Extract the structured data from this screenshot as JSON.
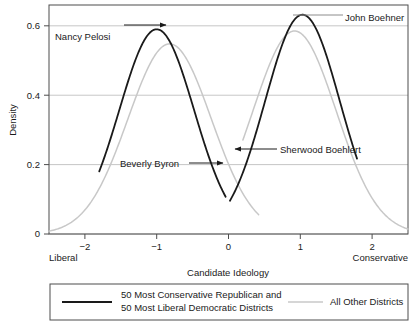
{
  "chart_data": {
    "type": "line",
    "title": "",
    "xlabel": "Candidate Ideology",
    "ylabel": "Density",
    "xlim": [
      -2.5,
      2.5
    ],
    "ylim": [
      0,
      0.66
    ],
    "grid": true,
    "grid_axis": "y",
    "legend_position": "bottom",
    "x_ticks": [
      -2,
      -1,
      0,
      1,
      2
    ],
    "x_tick_labels": [
      "−2",
      "−1",
      "0",
      "1",
      "2"
    ],
    "y_ticks": [
      0,
      0.2,
      0.4,
      0.6
    ],
    "y_tick_labels": [
      "0",
      "0.2",
      "0.4",
      "0.6"
    ],
    "x_axis_end_labels": {
      "left": "Liberal",
      "right": "Conservative"
    },
    "series": [
      {
        "name": "50 Most Conservative Republican and 50 Most Liberal Democratic Districts",
        "color": "#1a1a1a",
        "linewidth": 1.8,
        "modes": [
          {
            "peak_x": -1.0,
            "peak_y": 0.59,
            "sigma": 0.52,
            "x_start": -1.8,
            "x_end": -0.04,
            "y_start": 0.305,
            "y_end": 0.215
          },
          {
            "peak_x": 1.03,
            "peak_y": 0.632,
            "sigma": 0.52,
            "x_start": 0.02,
            "x_end": 1.79,
            "y_start": 0.168,
            "y_end": 0.345
          }
        ]
      },
      {
        "name": "All Other Districts",
        "color": "#c8c8c8",
        "linewidth": 1.5,
        "modes": [
          {
            "peak_x": -0.82,
            "peak_y": 0.548,
            "sigma": 0.58,
            "x_start": -2.5,
            "x_end": 0.42,
            "y_start": 0.021,
            "y_end": 0.018
          },
          {
            "peak_x": 0.92,
            "peak_y": 0.585,
            "sigma": 0.58,
            "x_start": 0.2,
            "x_end": 2.5,
            "y_start": 0.02,
            "y_end": 0.017
          }
        ]
      }
    ],
    "annotations": [
      {
        "label": "Nancy Pelosi",
        "text_x": 55,
        "text_y": 40,
        "anchor": "start",
        "arrow": {
          "x1": 124,
          "y1": 25,
          "x2": 166,
          "y2": 25,
          "head": "end"
        }
      },
      {
        "label": "John Boehner",
        "text_x": 345,
        "text_y": 21,
        "anchor": "start",
        "arrow": {
          "x1": 293,
          "y1": 15,
          "x2": 343,
          "y2": 15,
          "head": "none"
        }
      },
      {
        "label": "Beverly Byron",
        "text_x": 120,
        "text_y": 167,
        "anchor": "start",
        "arrow": {
          "x1": 189,
          "y1": 163,
          "x2": 223,
          "y2": 163,
          "head": "end"
        }
      },
      {
        "label": "Sherwood Boehlert",
        "text_x": 280,
        "text_y": 153,
        "anchor": "start",
        "arrow": {
          "x1": 277,
          "y1": 149,
          "x2": 235,
          "y2": 149,
          "head": "end"
        }
      }
    ],
    "legend_entries": [
      {
        "lines": [
          "50 Most Conservative Republican and",
          "50 Most Liberal Democratic Districts"
        ],
        "color": "#1a1a1a",
        "linewidth": 2
      },
      {
        "lines": [
          "All Other Districts"
        ],
        "color": "#c8c8c8",
        "linewidth": 1.5
      }
    ]
  }
}
